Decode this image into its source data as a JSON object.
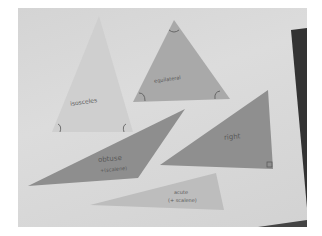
{
  "scene": {
    "description": "Photo of paper triangles labeled with triangle types on a light surface",
    "colors": {
      "background": "#ffffff",
      "surface": "#d8d8d8",
      "isosceles": "#cfcfcf",
      "equilateral": "#a9a9a9",
      "obtuse": "#8e8e8e",
      "right": "#8f8f8f",
      "acute": "#bdbdbd",
      "dark_edge": "#333333"
    }
  },
  "triangles": [
    {
      "name": "isosceles",
      "label": "isosceles"
    },
    {
      "name": "equilateral",
      "label": "equilateral"
    },
    {
      "name": "obtuse",
      "label": "obtuse",
      "sublabel": "+(scalene)"
    },
    {
      "name": "right",
      "label": "right"
    },
    {
      "name": "acute",
      "label": "acute",
      "sublabel": "(+ scalene)"
    }
  ]
}
